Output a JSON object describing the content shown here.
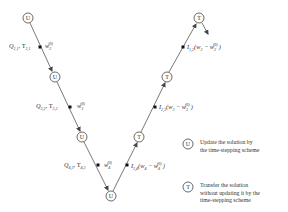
{
  "diagram": {
    "nodes": [
      {
        "id": "u1",
        "letter": "U",
        "x": 28,
        "y": 18
      },
      {
        "id": "u2",
        "letter": "U",
        "x": 55,
        "y": 77
      },
      {
        "id": "u3",
        "letter": "U",
        "x": 82,
        "y": 137
      },
      {
        "id": "u4",
        "letter": "U",
        "x": 111,
        "y": 196
      },
      {
        "id": "t1",
        "letter": "T",
        "x": 139,
        "y": 137
      },
      {
        "id": "t2",
        "letter": "T",
        "x": 167,
        "y": 77
      },
      {
        "id": "t3",
        "letter": "T",
        "x": 199,
        "y": 18
      }
    ],
    "edge_labels": {
      "q21_left": "Q",
      "q21_sub": "2,1",
      "t21": "T",
      "t21_sub": "2,1",
      "w2_base": "w",
      "w2_sub": "2",
      "w2_sup": "(0)",
      "q32_left": "Q",
      "q32_sub": "3,2",
      "t32": "T",
      "t32_sub": "3,2",
      "w3_base": "w",
      "w3_sub": "3",
      "w3_sup": "(0)",
      "q43_left": "Q",
      "q43_sub": "4,3",
      "t43": "T",
      "t43_sub": "4,3",
      "w4_base": "w",
      "w4_sub": "4",
      "w4_sup": "(0)",
      "i34": "I",
      "i34_sub": "3,4",
      "i34_expr_a": "(w",
      "i34_expr_sub": "4",
      "i34_expr_b": " − w",
      "i34_expr_sub2": "4",
      "i34_expr_sup": "(0)",
      "i34_close": ")",
      "i23": "I",
      "i23_sub": "2,3",
      "i23_expr_a": "(w",
      "i23_expr_sub": "3",
      "i23_expr_b": " − w",
      "i23_expr_sub2": "3",
      "i23_expr_sup": "(0)",
      "i23_close": ")",
      "i12": "I",
      "i12_sub": "1,2",
      "i12_expr_a": "(w",
      "i12_expr_sub": "2",
      "i12_expr_b": " − w",
      "i12_expr_sub2": "2",
      "i12_expr_sup": "(0)",
      "i12_close": ")",
      "comma": ", "
    },
    "legend": {
      "u_letter": "U",
      "u_line1": "Update the solution by",
      "u_line2": "the time-stepping scheme",
      "t_letter": "T",
      "t_line1": "Transfer the solution",
      "t_line2": "without updating it by the",
      "t_line3": "time-stepping scheme"
    },
    "colors": {
      "line": "#444444",
      "text": "#333333",
      "background": "#ffffff"
    }
  }
}
